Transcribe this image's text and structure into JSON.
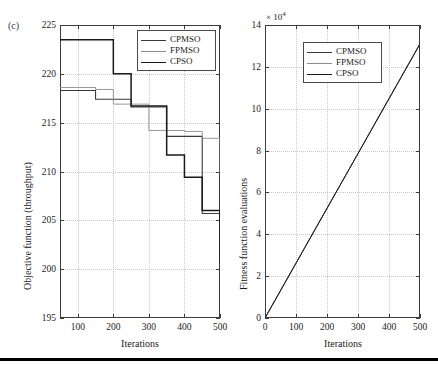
{
  "figure": {
    "panel_label": "(c)",
    "bottom_rule": true
  },
  "legend_entries": [
    {
      "label": "CPMSO",
      "color": "#3a3a3a",
      "width": 1.6
    },
    {
      "label": "FPMSO",
      "color": "#8c8c8c",
      "width": 1.0
    },
    {
      "label": "CPSO",
      "color": "#1a1a1a",
      "width": 1.9
    }
  ],
  "chart_data": [
    {
      "id": "objective-function-chart",
      "type": "line",
      "title": "",
      "panel": "(c)",
      "xlabel": "Iterations",
      "ylabel": "Objective function (throughput)",
      "xlim": [
        50,
        500
      ],
      "ylim": [
        195,
        225
      ],
      "xticks": [
        100,
        200,
        300,
        400,
        500
      ],
      "yticks": [
        195,
        200,
        205,
        210,
        215,
        220,
        225
      ],
      "grid": true,
      "legend_position": "top-right",
      "step": "post",
      "series": [
        {
          "name": "CPMSO",
          "color": "#3a3a3a",
          "x": [
            50,
            100,
            150,
            200,
            250,
            300,
            350,
            400,
            450,
            500
          ],
          "y": [
            218.3,
            218.3,
            217.4,
            217.4,
            216.6,
            216.6,
            213.6,
            213.6,
            205.7,
            202.5
          ]
        },
        {
          "name": "FPMSO",
          "color": "#8c8c8c",
          "x": [
            50,
            100,
            150,
            200,
            250,
            300,
            350,
            400,
            450,
            500
          ],
          "y": [
            218.6,
            218.6,
            218.4,
            216.9,
            216.9,
            214.2,
            214.2,
            214.1,
            213.4,
            209.9
          ]
        },
        {
          "name": "CPSO",
          "color": "#1a1a1a",
          "x": [
            50,
            100,
            150,
            200,
            250,
            300,
            350,
            400,
            450,
            500
          ],
          "y": [
            223.5,
            223.5,
            223.5,
            220.0,
            216.7,
            216.7,
            211.7,
            209.4,
            206.0,
            200.6
          ]
        }
      ]
    },
    {
      "id": "fitness-evaluations-chart",
      "type": "line",
      "title": "",
      "xlabel": "Iterations",
      "ylabel": "Fitness function evaluations",
      "y_exponent_label": "× 10",
      "y_exponent_power": "4",
      "xlim": [
        0,
        500
      ],
      "ylim": [
        0,
        14
      ],
      "xticks": [
        0,
        100,
        200,
        300,
        400,
        500
      ],
      "yticks": [
        0,
        2,
        4,
        6,
        8,
        10,
        12,
        14
      ],
      "grid": true,
      "legend_position": "top-left-inset",
      "series": [
        {
          "name": "CPMSO",
          "color": "#3a3a3a",
          "x": [
            0,
            100,
            200,
            300,
            400,
            500
          ],
          "y": [
            0,
            2.62,
            5.24,
            7.86,
            10.48,
            13.1
          ]
        },
        {
          "name": "FPMSO",
          "color": "#8c8c8c",
          "x": [
            0,
            100,
            200,
            300,
            400,
            500
          ],
          "y": [
            0,
            2.62,
            5.24,
            7.86,
            10.48,
            13.1
          ]
        },
        {
          "name": "CPSO",
          "color": "#1a1a1a",
          "x": [
            0,
            100,
            200,
            300,
            400,
            500
          ],
          "y": [
            0,
            2.62,
            5.24,
            7.86,
            10.48,
            13.1
          ]
        }
      ]
    }
  ]
}
